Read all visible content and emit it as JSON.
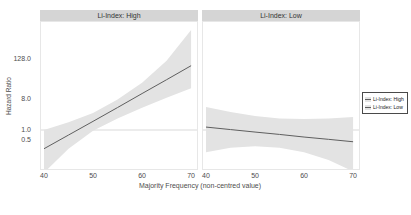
{
  "chart_data": {
    "type": "line",
    "xlabel": "Majority Frequency (non-centred value)",
    "ylabel": "Hazard Ratio",
    "x_scale": {
      "min": 40,
      "max": 70,
      "ticks": [
        40,
        50,
        60,
        70
      ],
      "tick_labels": [
        "40",
        "50",
        "60",
        "70"
      ]
    },
    "y_scale": {
      "type": "log2",
      "ticks": [
        128.0,
        8.0,
        1.0,
        0.5
      ],
      "tick_labels": [
        "128.0",
        "8.0",
        "1.0",
        "0.5"
      ],
      "reference_line": 1.0
    },
    "facets": [
      {
        "label": "Li-Index: High",
        "x": [
          40,
          45,
          50,
          55,
          60,
          65,
          70
        ],
        "hazard_ratio": [
          0.28,
          0.71,
          1.8,
          4.6,
          11.9,
          30.5,
          79
        ],
        "ci_low": [
          0.055,
          0.28,
          0.95,
          2.2,
          4.5,
          9,
          17
        ],
        "ci_high": [
          1.0,
          1.7,
          3.2,
          8,
          25,
          110,
          900
        ]
      },
      {
        "label": "Li-Index: Low",
        "x": [
          40,
          45,
          50,
          55,
          60,
          65,
          70
        ],
        "hazard_ratio": [
          1.22,
          1.03,
          0.87,
          0.74,
          0.62,
          0.53,
          0.45
        ],
        "ci_low": [
          0.22,
          0.3,
          0.33,
          0.3,
          0.22,
          0.13,
          0.06
        ],
        "ci_high": [
          4.8,
          3.4,
          2.6,
          2.2,
          2.1,
          2.2,
          2.4
        ]
      }
    ],
    "legend_position": "right",
    "grid": "reference line at hazard ratio 1.0 only"
  },
  "legend": {
    "items": [
      {
        "label": "Li-Index: High"
      },
      {
        "label": "Li-Index: Low"
      }
    ]
  },
  "colors": {
    "strip_background": "#d5d5d5",
    "confidence_band": "#e3e3e3",
    "trend_line": "#5f5f5f",
    "reference_line": "#d9d9d9",
    "axis_text": "#4d4d4d",
    "legend_border": "#4a4a4a"
  }
}
